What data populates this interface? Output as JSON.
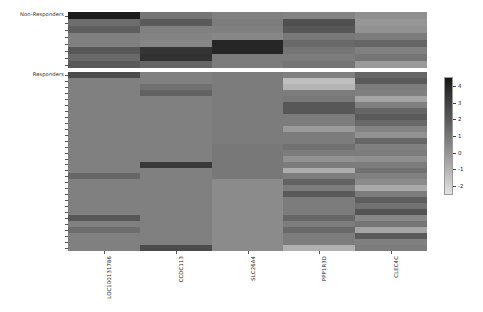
{
  "figure": {
    "type": "heatmap",
    "background_color": "#ffffff",
    "colormap": "grays-reversed"
  },
  "groups": {
    "non_responders_label": "Non-Responders",
    "responders_label": "Responders"
  },
  "gene_labels": [
    "LOC100131786",
    "CCDC113",
    "SLC26A4",
    "PPP1R3D",
    "CLEC4C"
  ],
  "colorbar": {
    "ticks": [
      "4",
      "3",
      "2",
      "1",
      "0",
      "-1",
      "-2"
    ],
    "tick_positions_pct": [
      8,
      22,
      36,
      50,
      64,
      78,
      92
    ],
    "high_color": "#151515",
    "low_color": "#e4e4e4",
    "vmin": -2,
    "vmax": 4
  },
  "chart_data": {
    "type": "heatmap",
    "title": "",
    "xlabel": "",
    "ylabel": "",
    "grid": false,
    "legend_position": "right",
    "colorbar_label": "",
    "zlim": [
      -2,
      4
    ],
    "columns": [
      "LOC100131786",
      "CCDC113",
      "SLC26A4",
      "PPP1R3D",
      "CLEC4C"
    ],
    "row_groups": [
      "Non-Responders",
      "Responders"
    ],
    "non_responders": {
      "n_rows": 8,
      "values": [
        [
          3.6,
          1.2,
          0.9,
          0.8,
          0.5
        ],
        [
          1.4,
          1.9,
          1.0,
          2.2,
          0.3
        ],
        [
          1.8,
          0.9,
          0.9,
          2.0,
          0.4
        ],
        [
          0.9,
          0.8,
          0.7,
          1.1,
          1.0
        ],
        [
          0.9,
          0.7,
          3.3,
          1.5,
          1.6
        ],
        [
          2.0,
          2.9,
          3.3,
          1.2,
          0.9
        ],
        [
          1.5,
          3.0,
          1.0,
          1.0,
          1.2
        ],
        [
          1.9,
          1.6,
          1.0,
          1.2,
          0.2
        ]
      ]
    },
    "responders": {
      "n_rows": 30,
      "values": [
        [
          2.3,
          0.9,
          1.0,
          0.9,
          1.6
        ],
        [
          0.9,
          0.9,
          1.0,
          -0.8,
          1.9
        ],
        [
          0.9,
          1.3,
          1.0,
          -0.5,
          1.0
        ],
        [
          0.9,
          1.7,
          1.0,
          1.0,
          0.9
        ],
        [
          0.9,
          0.9,
          1.0,
          1.1,
          -0.1
        ],
        [
          0.9,
          0.9,
          1.0,
          2.0,
          0.9
        ],
        [
          0.9,
          0.9,
          1.0,
          2.0,
          1.6
        ],
        [
          0.9,
          0.9,
          1.0,
          1.0,
          1.9
        ],
        [
          0.9,
          0.9,
          1.0,
          1.0,
          1.5
        ],
        [
          0.9,
          0.9,
          1.0,
          0.2,
          0.8
        ],
        [
          0.9,
          0.9,
          1.0,
          1.0,
          0.4
        ],
        [
          0.9,
          0.9,
          1.0,
          1.0,
          1.6
        ],
        [
          0.9,
          0.9,
          1.1,
          1.3,
          0.9
        ],
        [
          0.9,
          0.9,
          1.1,
          1.0,
          1.0
        ],
        [
          0.9,
          0.9,
          1.1,
          0.4,
          0.5
        ],
        [
          0.9,
          2.8,
          1.1,
          1.0,
          1.0
        ],
        [
          0.9,
          0.9,
          1.1,
          -0.3,
          1.3
        ],
        [
          1.6,
          0.9,
          1.1,
          1.0,
          0.9
        ],
        [
          0.9,
          0.9,
          0.6,
          1.7,
          0.6
        ],
        [
          0.9,
          0.9,
          0.6,
          1.0,
          -0.2
        ],
        [
          0.9,
          0.9,
          0.6,
          1.9,
          1.0
        ],
        [
          0.9,
          0.9,
          0.6,
          1.0,
          1.8
        ],
        [
          0.9,
          0.9,
          0.6,
          1.0,
          1.3
        ],
        [
          0.9,
          0.9,
          0.6,
          1.0,
          2.1
        ],
        [
          2.0,
          0.9,
          0.6,
          1.6,
          0.7
        ],
        [
          0.9,
          0.9,
          0.6,
          1.0,
          1.2
        ],
        [
          1.4,
          0.9,
          0.6,
          1.5,
          -0.1
        ],
        [
          0.9,
          0.9,
          0.6,
          1.0,
          1.9
        ],
        [
          0.9,
          0.9,
          0.6,
          1.0,
          0.9
        ],
        [
          0.9,
          2.3,
          0.6,
          -0.4,
          1.0
        ]
      ]
    }
  }
}
